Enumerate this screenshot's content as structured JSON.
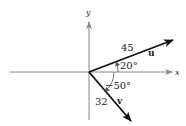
{
  "diagram": {
    "axes": {
      "x_label": "x",
      "y_label": "y"
    },
    "vectors": [
      {
        "name": "u",
        "magnitude_label": "45",
        "angle_label": "20°",
        "angle_deg": 20
      },
      {
        "name": "v",
        "magnitude_label": "32",
        "angle_label": "−50°",
        "angle_deg": -50
      }
    ],
    "colors": {
      "axis": "#888888",
      "vector": "#111111",
      "text": "#222222"
    }
  }
}
